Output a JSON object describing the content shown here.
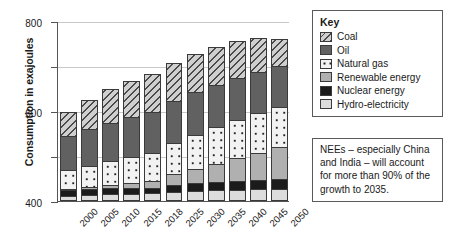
{
  "chart_data": {
    "type": "bar",
    "stacked": true,
    "title": "",
    "xlabel": "",
    "ylabel": "Consumption in exajoules",
    "ylim": [
      0,
      800
    ],
    "yticks": [
      0,
      200,
      400,
      600,
      800
    ],
    "grid": true,
    "legend_position": "top-right",
    "categories": [
      "2000",
      "2005",
      "2010",
      "2015",
      "2018",
      "2025",
      "2030",
      "2035",
      "2040",
      "2045",
      "2050"
    ],
    "series": [
      {
        "name": "Hydro-electricity",
        "color": "#dcdcdc",
        "pattern": "solid-light",
        "values": [
          24,
          27,
          30,
          33,
          35,
          40,
          44,
          47,
          50,
          52,
          54
        ]
      },
      {
        "name": "Nuclear energy",
        "color": "#1b1b1b",
        "pattern": "solid-black",
        "values": [
          26,
          28,
          28,
          24,
          25,
          30,
          34,
          37,
          40,
          42,
          44
        ]
      },
      {
        "name": "Renewable energy",
        "color": "#b0b0b0",
        "pattern": "solid-mid",
        "values": [
          5,
          8,
          14,
          22,
          30,
          48,
          65,
          82,
          100,
          120,
          140
        ]
      },
      {
        "name": "Natural gas",
        "color": "#f2f2f2",
        "pattern": "dots",
        "values": [
          82,
          92,
          105,
          115,
          125,
          140,
          152,
          162,
          170,
          176,
          182
        ]
      },
      {
        "name": "Oil",
        "color": "#616161",
        "pattern": "solid-dark",
        "values": [
          152,
          163,
          172,
          178,
          182,
          186,
          188,
          188,
          186,
          182,
          178
        ]
      },
      {
        "name": "Coal",
        "color": "#cfcfcf",
        "pattern": "diagonal-hatch",
        "values": [
          106,
          132,
          151,
          163,
          168,
          171,
          172,
          170,
          166,
          152,
          122
        ]
      }
    ],
    "totals": [
      395,
      450,
      500,
      535,
      565,
      615,
      655,
      686,
      712,
      724,
      720
    ]
  },
  "legend": {
    "title": "Key",
    "items": [
      {
        "label": "Coal",
        "swatch": "diagonal-hatch"
      },
      {
        "label": "Oil",
        "swatch": "solid-dark"
      },
      {
        "label": "Natural gas",
        "swatch": "dots"
      },
      {
        "label": "Renewable energy",
        "swatch": "solid-mid"
      },
      {
        "label": "Nuclear energy",
        "swatch": "solid-black"
      },
      {
        "label": "Hydro-electricity",
        "swatch": "solid-light"
      }
    ]
  },
  "annotation": {
    "text": "NEEs – especially China and India – will account for more than 90% of the growth to 2035."
  },
  "colors": {
    "coal": "#cfcfcf",
    "oil": "#616161",
    "natural_gas": "#f2f2f2",
    "renewable": "#b0b0b0",
    "nuclear": "#1b1b1b",
    "hydro": "#dcdcdc",
    "grid": "#c8c8c8",
    "axis": "#555555"
  }
}
